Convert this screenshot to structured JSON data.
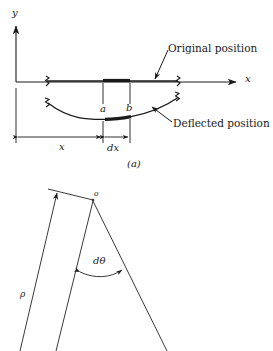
{
  "figure": {
    "title_a": "(a)",
    "colors": {
      "ink": "#1a1a1a",
      "line": "#3a3a3a",
      "background": "#ffffff"
    }
  },
  "panel_a": {
    "axis_y_label": "y",
    "axis_x_label": "x",
    "callout_original": "Original position",
    "callout_deflected": "Deflected position",
    "point_a": "a",
    "point_b": "b",
    "dim_x": "x",
    "dim_dx": "dx",
    "caption": "(a)"
  },
  "panel_b": {
    "center_label": "o",
    "radius_label": "ρ",
    "angle_label": "dθ"
  }
}
